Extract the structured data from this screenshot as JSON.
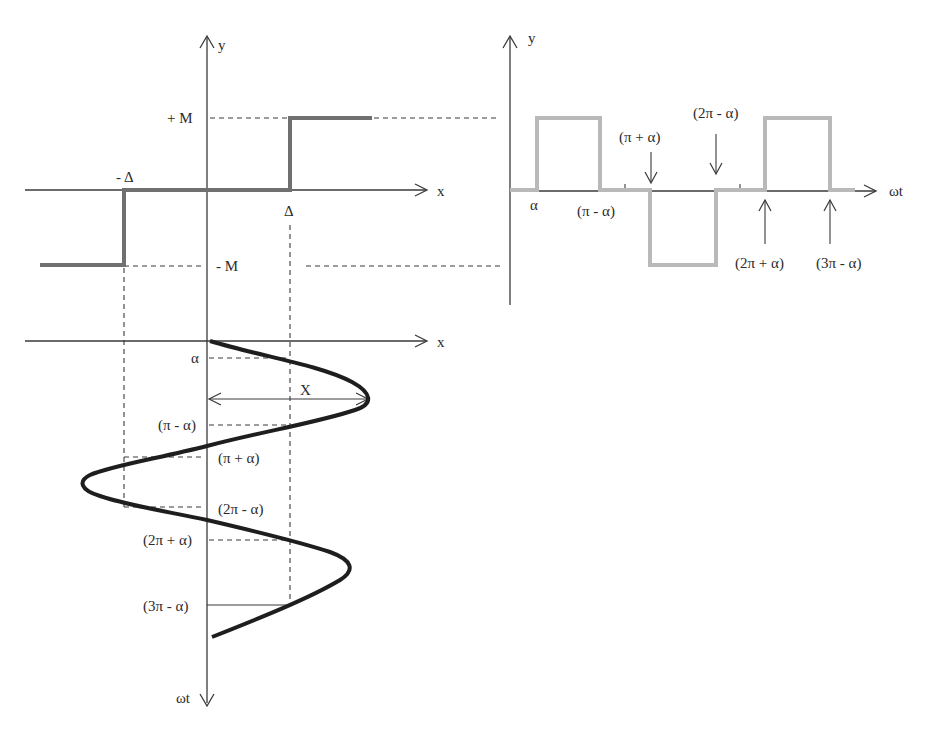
{
  "diagram": {
    "nonlinearity_plot": {
      "y_axis_label": "y",
      "x_axis_label": "x",
      "levels": {
        "plus_m": "+ M",
        "minus_m": "- M"
      },
      "thresholds": {
        "plus_delta": "Δ",
        "minus_delta": "- Δ"
      }
    },
    "input_plot": {
      "x_axis_label": "x",
      "time_axis_label": "ωt",
      "amplitude_label": "X",
      "angle_labels": [
        "α",
        "(π - α)",
        "(π + α)",
        "(2π - α)",
        "(2π + α)",
        "(3π - α)"
      ]
    },
    "output_plot": {
      "y_axis_label": "y",
      "time_axis_label": "ωt",
      "angle_labels": {
        "alpha": "α",
        "pi_minus_alpha": "(π - α)",
        "pi_plus_alpha": "(π + α)",
        "two_pi_minus_alpha": "(2π - α)",
        "two_pi_plus_alpha": "(2π + α)",
        "three_pi_minus_alpha": "(3π - α)"
      }
    },
    "colors": {
      "axes": "#3a3a3a",
      "step_characteristic": "#707070",
      "output_waveform": "#b9b9b9",
      "input_sinusoid": "#1e1e1e"
    }
  }
}
